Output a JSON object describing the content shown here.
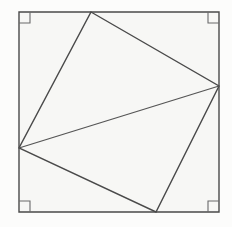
{
  "figure": {
    "canvas": {
      "width": 232,
      "height": 227
    },
    "background_color": "#fcfcfb",
    "plot_background_color": "#f7f7f5",
    "line_color": "#4a4a4a",
    "diagonal_color": "#555555",
    "marker_color": "#6a6a6a",
    "line_width": 1.4,
    "diagonal_width": 1.3,
    "marker_width": 1.1
  },
  "chart_data": {
    "type": "diagram",
    "xlabel": "",
    "ylabel": "",
    "xlim": [
      0,
      232
    ],
    "ylim": [
      227,
      0
    ],
    "grid": false,
    "legend": null,
    "shapes": [
      {
        "name": "outer-square",
        "kind": "polygon",
        "closed": true,
        "points": [
          [
            19,
            12
          ],
          [
            219,
            12
          ],
          [
            219,
            212
          ],
          [
            19,
            212
          ]
        ],
        "stroke": "#4a4a4a",
        "fill": "#f7f7f5",
        "side_length": 200
      },
      {
        "name": "inscribed-quadrilateral",
        "kind": "polygon",
        "closed": true,
        "points": [
          [
            91,
            12
          ],
          [
            219,
            86
          ],
          [
            156,
            212
          ],
          [
            19,
            148
          ]
        ],
        "stroke": "#4a4a4a",
        "fill": "none"
      },
      {
        "name": "diagonal",
        "kind": "line",
        "closed": false,
        "points": [
          [
            19,
            148
          ],
          [
            219,
            86
          ]
        ],
        "stroke": "#555555",
        "fill": "none"
      }
    ],
    "vertices": [
      {
        "name": "top-vertex",
        "x": 91,
        "y": 12,
        "on_edge": "top"
      },
      {
        "name": "right-vertex",
        "x": 219,
        "y": 86,
        "on_edge": "right"
      },
      {
        "name": "bottom-vertex",
        "x": 156,
        "y": 212,
        "on_edge": "bottom"
      },
      {
        "name": "left-vertex",
        "x": 19,
        "y": 148,
        "on_edge": "left"
      }
    ],
    "right_angle_markers": [
      {
        "name": "right-angle-marker-top-left",
        "corner": "top-left",
        "x": 19,
        "y": 12,
        "size": 11
      },
      {
        "name": "right-angle-marker-top-right",
        "corner": "top-right",
        "x": 219,
        "y": 12,
        "size": 11
      },
      {
        "name": "right-angle-marker-bottom-left",
        "corner": "bottom-left",
        "x": 19,
        "y": 212,
        "size": 11
      },
      {
        "name": "right-angle-marker-bottom-right",
        "corner": "bottom-right",
        "x": 219,
        "y": 212,
        "size": 11
      }
    ],
    "labels": []
  }
}
